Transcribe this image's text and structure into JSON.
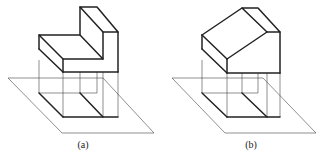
{
  "figures": [
    {
      "id": "a",
      "label": "(a)",
      "shape": "L-shaped stepped block projected onto horizontal plane"
    },
    {
      "id": "b",
      "label": "(b)",
      "shape": "block with sloped top projected onto horizontal plane"
    }
  ],
  "colors": {
    "line": "#222222",
    "background": "#ffffff"
  }
}
